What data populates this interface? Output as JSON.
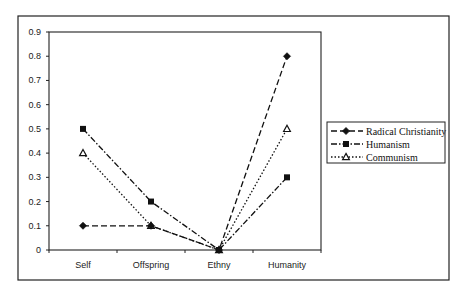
{
  "chart_data": {
    "type": "line",
    "title": "",
    "xlabel": "",
    "ylabel": "",
    "categories": [
      "Self",
      "Offspring",
      "Ethny",
      "Humanity"
    ],
    "ylim": [
      0,
      0.9
    ],
    "yticks": [
      "0",
      "0.1",
      "0.2",
      "0.3",
      "0.4",
      "0.5",
      "0.6",
      "0.7",
      "0.8",
      "0.9"
    ],
    "grid": false,
    "legend_position": "right",
    "series": [
      {
        "name": "Radical Christianity",
        "marker": "diamond",
        "line_style": "dashed",
        "values": [
          0.1,
          0.1,
          0.0,
          0.8
        ]
      },
      {
        "name": "Humanism",
        "marker": "square",
        "line_style": "dash-dot",
        "values": [
          0.5,
          0.2,
          0.0,
          0.3
        ]
      },
      {
        "name": "Communism",
        "marker": "triangle-open",
        "line_style": "dotted",
        "values": [
          0.4,
          0.1,
          0.0,
          0.5
        ]
      }
    ]
  },
  "colors": {
    "line": "#111111",
    "frame": "#222222",
    "background": "#ffffff"
  }
}
